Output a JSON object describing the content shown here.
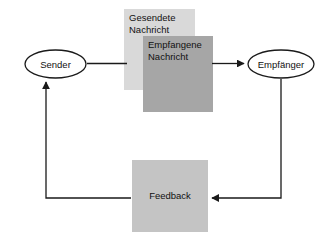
{
  "diagram": {
    "background_color": "#ffffff",
    "stroke_color": "#1a1a1a",
    "nodes": {
      "sender": {
        "label": "Sender",
        "shape": "ellipse",
        "fill": "#ffffff"
      },
      "receiver": {
        "label": "Empfänger",
        "shape": "ellipse",
        "fill": "#ffffff"
      },
      "sent_message": {
        "label": "Gesendete\nNachricht",
        "shape": "rectangle",
        "fill": "#d9d9d9"
      },
      "received_message": {
        "label": "Empfangene\nNachricht",
        "shape": "rectangle",
        "fill": "#a6a6a6"
      },
      "feedback": {
        "label": "Feedback",
        "shape": "rectangle",
        "fill": "#c4c4c4"
      }
    },
    "connectors": [
      {
        "name": "sender-to-sent-message",
        "from": "sender",
        "to": "sent_message",
        "arrowhead": false,
        "label": ""
      },
      {
        "name": "received-message-to-receiver",
        "from": "received_message",
        "to": "receiver",
        "arrowhead": true,
        "label": ""
      },
      {
        "name": "receiver-to-feedback",
        "from": "receiver",
        "to": "feedback",
        "arrowhead": true,
        "label": ""
      },
      {
        "name": "feedback-to-sender",
        "from": "feedback",
        "to": "sender",
        "arrowhead": true,
        "label": ""
      }
    ]
  }
}
